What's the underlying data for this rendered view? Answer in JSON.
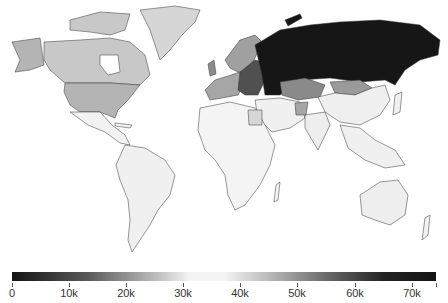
{
  "map": {
    "type": "choropleth",
    "projection": "world",
    "palette": "diverging-grayscale (dark-light-dark)",
    "regions": [
      {
        "name": "Canada",
        "shade": "#c8c8c8"
      },
      {
        "name": "United States",
        "shade": "#b4b4b4"
      },
      {
        "name": "Greenland",
        "shade": "#d6d6d6"
      },
      {
        "name": "Mexico/Central America",
        "shade": "#f2f2f2"
      },
      {
        "name": "South America",
        "shade": "#f0f0f0"
      },
      {
        "name": "Europe",
        "shade": "#8c8c8c"
      },
      {
        "name": "Scandinavia",
        "shade": "#a0a0a0"
      },
      {
        "name": "Eastern Europe",
        "shade": "#505050"
      },
      {
        "name": "Russia",
        "shade": "#161616"
      },
      {
        "name": "Kazakhstan",
        "shade": "#8a8a8a"
      },
      {
        "name": "Mongolia",
        "shade": "#9a9a9a"
      },
      {
        "name": "China",
        "shade": "#efefef"
      },
      {
        "name": "Middle East",
        "shade": "#f0f0f0"
      },
      {
        "name": "Afghanistan",
        "shade": "#a6a6a6"
      },
      {
        "name": "Egypt",
        "shade": "#d6d6d6"
      },
      {
        "name": "Africa",
        "shade": "#f4f4f4"
      },
      {
        "name": "India",
        "shade": "#eeeeee"
      },
      {
        "name": "Southeast Asia",
        "shade": "#f0f0f0"
      },
      {
        "name": "Australia",
        "shade": "#eeeeee"
      },
      {
        "name": "New Zealand",
        "shade": "#f2f2f2"
      }
    ]
  },
  "colorbar": {
    "min": 0,
    "max": 74000,
    "ticks": [
      {
        "label": "0",
        "x": 12
      },
      {
        "label": "10k",
        "x": 69
      },
      {
        "label": "20k",
        "x": 126
      },
      {
        "label": "30k",
        "x": 183
      },
      {
        "label": "40k",
        "x": 240
      },
      {
        "label": "50k",
        "x": 297
      },
      {
        "label": "60k",
        "x": 355
      },
      {
        "label": "70k",
        "x": 412
      }
    ],
    "end_tick_x": 436
  }
}
